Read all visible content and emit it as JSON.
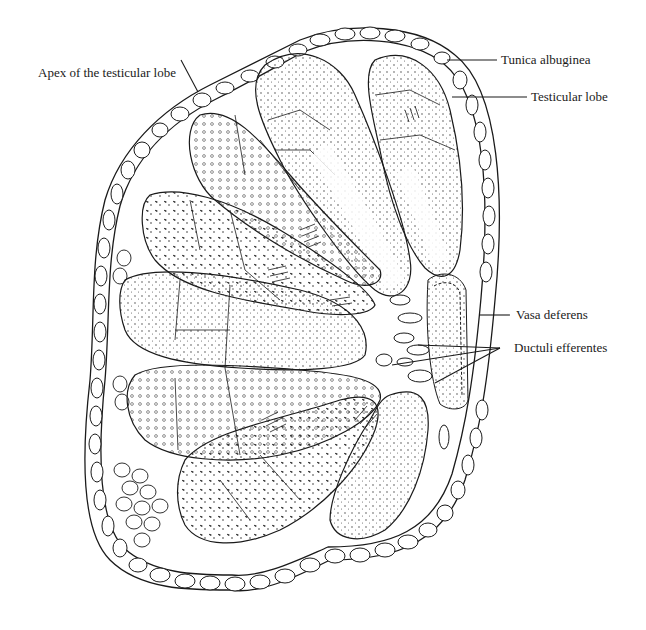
{
  "figure": {
    "labels": [
      {
        "id": "apex",
        "text": "Apex of the testicular lobe"
      },
      {
        "id": "tunica",
        "text": "Tunica albuginea"
      },
      {
        "id": "lobe",
        "text": "Testicular lobe"
      },
      {
        "id": "vasa",
        "text": "Vasa deferens"
      },
      {
        "id": "ductuli",
        "text": "Ductuli efferentes"
      }
    ],
    "colors": {
      "ink": "#1a1a1a",
      "background": "#ffffff"
    }
  }
}
